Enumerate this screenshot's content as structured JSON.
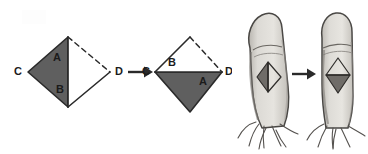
{
  "figure": {
    "background_color": "#ffffff",
    "ink_color": "#2a2a2a",
    "fill_gray": "#5f5f5f",
    "skin_light": "#e4e2dd",
    "skin_mid": "#c9c6c0",
    "skin_shadow": "#8d8a86"
  },
  "geometry": {
    "step_one": {
      "name": "pre-transposition-rhombus",
      "labels": {
        "flap": "A",
        "defect": "B",
        "left_vertex": "C",
        "right_vertex": "D"
      },
      "shaded_region": "A",
      "dashed_edges": "upper-right",
      "solid_edges": "left-and-lower"
    },
    "step_two": {
      "name": "post-transposition-rhombus",
      "labels": {
        "flap": "A",
        "defect": "B",
        "left_vertex": "C",
        "right_vertex": "D"
      },
      "shaded_region": "A",
      "dashed_edges": "upper-right",
      "solid_edges": "upper-left-and-lower"
    },
    "arrow": {
      "name": "transposition-arrow",
      "direction": "right",
      "glyph": "→"
    }
  },
  "anatomy": {
    "left_finger": {
      "name": "finger-before",
      "marking": "rhombus-flap-outline",
      "shaded_half": "left"
    },
    "right_finger": {
      "name": "finger-after",
      "marking": "rhombus-flap-outline",
      "shaded_half": "bottom"
    },
    "arrow": {
      "name": "procedure-arrow",
      "direction": "right",
      "glyph": "→"
    }
  }
}
